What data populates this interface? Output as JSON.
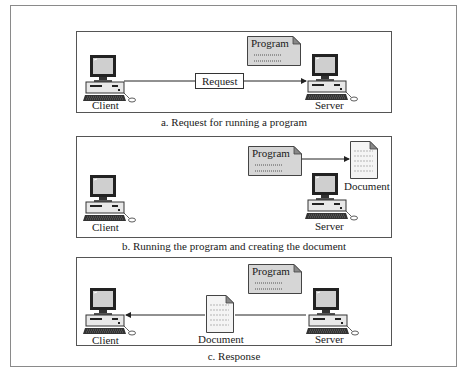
{
  "figure": {
    "panels": [
      {
        "id": "a",
        "caption": "a. Request for running a program",
        "client_label": "Client",
        "server_label": "Server",
        "program_label": "Program",
        "message_label": "Request"
      },
      {
        "id": "b",
        "caption": "b. Running the program and creating the document",
        "client_label": "Client",
        "server_label": "Server",
        "program_label": "Program",
        "document_label": "Document"
      },
      {
        "id": "c",
        "caption": "c. Response",
        "client_label": "Client",
        "server_label": "Server",
        "program_label": "Program",
        "document_label": "Document"
      }
    ]
  },
  "colors": {
    "program_fill": "#d6d6d6",
    "document_fill": "#f4f4f4",
    "border": "#555555"
  }
}
